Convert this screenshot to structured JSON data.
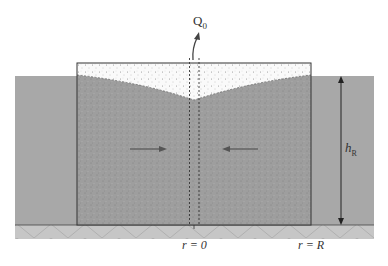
{
  "figure": {
    "colors": {
      "background": "#ffffff",
      "ground": "#a8a8a8",
      "saturated_fill": "#9e9e9e",
      "unsaturated_fill": "#f5f5f5",
      "base_layer": "#c4c4c4",
      "lines": "#333333"
    },
    "labels": {
      "discharge": "Q",
      "discharge_sub": "0",
      "height": "h",
      "height_sub": "R",
      "r_center": "r = 0",
      "r_edge": "r = R"
    },
    "elements": {
      "flow_arrows": [
        "inward-left",
        "inward-right"
      ],
      "dimension_arrow": "double-headed vertical",
      "well": "central dashed well"
    }
  }
}
